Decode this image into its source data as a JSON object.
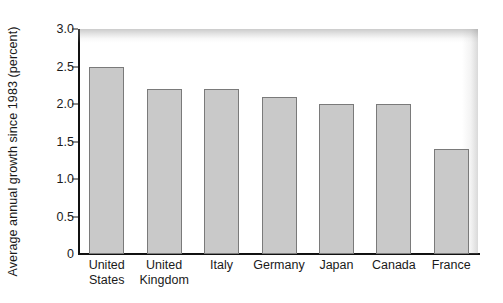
{
  "chart_data": {
    "type": "bar",
    "title": "",
    "subtitle": "",
    "xlabel": "",
    "ylabel": "Average annual growth since 1983 (percent)",
    "categories": [
      "United States",
      "United Kingdom",
      "Italy",
      "Germany",
      "Japan",
      "Canada",
      "France"
    ],
    "category_lines": [
      [
        "United",
        "States"
      ],
      [
        "United",
        "Kingdom"
      ],
      [
        "Italy"
      ],
      [
        "Germany"
      ],
      [
        "Japan"
      ],
      [
        "Canada"
      ],
      [
        "France"
      ]
    ],
    "values": [
      2.5,
      2.2,
      2.2,
      2.1,
      2.0,
      2.0,
      1.4
    ],
    "ylim": [
      0,
      3.0
    ],
    "yticks": [
      0,
      0.5,
      1.0,
      1.5,
      2.0,
      2.5,
      3.0
    ],
    "ytick_labels": [
      "0",
      "0.5",
      "1.0",
      "1.5",
      "2.0",
      "2.5",
      "3.0"
    ],
    "grid": false,
    "legend": false,
    "legend_position": "none",
    "bar_fill_color": "#c9c9c9",
    "bar_border_color": "#7a7a7a",
    "axis_color": "#111111",
    "background_color": "#ffffff"
  }
}
